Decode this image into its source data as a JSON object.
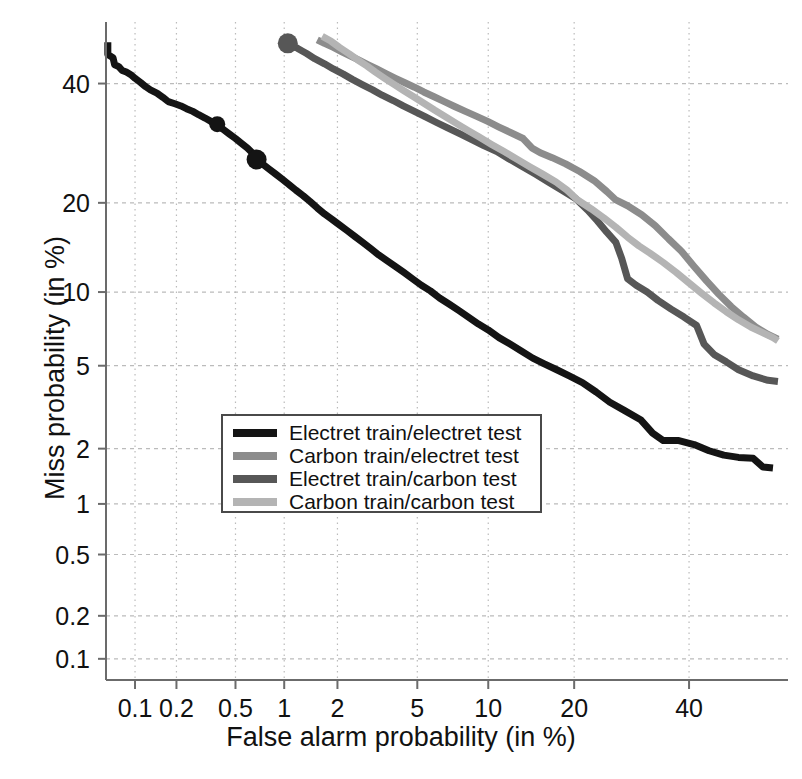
{
  "chart_data": {
    "type": "line",
    "title": "",
    "xlabel": "False alarm probability (in %)",
    "ylabel": "Miss probability (in %)",
    "scale": "probit (DET curve)",
    "grid": true,
    "xtick_labels": [
      "0.1",
      "0.2",
      "0.5",
      "1",
      "2",
      "5",
      "10",
      "20",
      "40"
    ],
    "xtick_values": [
      0.1,
      0.2,
      0.5,
      1,
      2,
      5,
      10,
      20,
      40
    ],
    "ytick_labels": [
      "40",
      "20",
      "10",
      "5",
      "2",
      "1",
      "0.5",
      "0.2",
      "0.1"
    ],
    "ytick_values": [
      40,
      20,
      10,
      5,
      2,
      1,
      0.5,
      0.2,
      0.1
    ],
    "xlim": [
      0.06,
      60
    ],
    "ylim": [
      0.07,
      52
    ],
    "legend_position": "center",
    "series": [
      {
        "name": "Electret train/electret test",
        "color": "#141414",
        "eer_marker": {
          "x": 0.68,
          "y": 26.5
        },
        "extra_marker": {
          "x": 0.38,
          "y": 32.5
        },
        "points": [
          [
            0.062,
            48.0
          ],
          [
            0.062,
            45.6
          ],
          [
            0.068,
            45.0
          ],
          [
            0.07,
            43.6
          ],
          [
            0.075,
            43.3
          ],
          [
            0.08,
            42.5
          ],
          [
            0.086,
            42.2
          ],
          [
            0.093,
            41.7
          ],
          [
            0.1,
            41.0
          ],
          [
            0.11,
            40.2
          ],
          [
            0.12,
            39.4
          ],
          [
            0.13,
            38.8
          ],
          [
            0.145,
            38.2
          ],
          [
            0.16,
            37.4
          ],
          [
            0.175,
            36.6
          ],
          [
            0.195,
            36.2
          ],
          [
            0.215,
            35.8
          ],
          [
            0.235,
            35.3
          ],
          [
            0.26,
            34.8
          ],
          [
            0.285,
            34.2
          ],
          [
            0.315,
            33.6
          ],
          [
            0.345,
            33.0
          ],
          [
            0.38,
            32.5
          ],
          [
            0.415,
            31.6
          ],
          [
            0.455,
            30.8
          ],
          [
            0.5,
            30.0
          ],
          [
            0.545,
            29.2
          ],
          [
            0.595,
            28.4
          ],
          [
            0.65,
            27.4
          ],
          [
            0.68,
            26.5
          ],
          [
            0.74,
            25.8
          ],
          [
            0.81,
            25.0
          ],
          [
            0.89,
            24.2
          ],
          [
            0.975,
            23.4
          ],
          [
            1.07,
            22.6
          ],
          [
            1.17,
            21.8
          ],
          [
            1.29,
            21.0
          ],
          [
            1.41,
            20.2
          ],
          [
            1.55,
            19.3
          ],
          [
            1.7,
            18.5
          ],
          [
            1.87,
            17.8
          ],
          [
            2.05,
            17.1
          ],
          [
            2.25,
            16.4
          ],
          [
            2.47,
            15.7
          ],
          [
            2.71,
            15.0
          ],
          [
            2.98,
            14.3
          ],
          [
            3.27,
            13.6
          ],
          [
            3.59,
            13.0
          ],
          [
            3.94,
            12.4
          ],
          [
            4.33,
            11.8
          ],
          [
            4.75,
            11.2
          ],
          [
            5.22,
            10.6
          ],
          [
            5.73,
            10.1
          ],
          [
            6.29,
            9.5
          ],
          [
            6.91,
            9.0
          ],
          [
            7.59,
            8.5
          ],
          [
            8.33,
            8.0
          ],
          [
            9.15,
            7.5
          ],
          [
            10.0,
            7.1
          ],
          [
            11.0,
            6.6
          ],
          [
            12.1,
            6.2
          ],
          [
            13.3,
            5.8
          ],
          [
            14.6,
            5.4
          ],
          [
            16.0,
            5.1
          ],
          [
            17.6,
            4.8
          ],
          [
            19.3,
            4.5
          ],
          [
            21.2,
            4.2
          ],
          [
            23.3,
            3.8
          ],
          [
            25.5,
            3.4
          ],
          [
            28.0,
            3.1
          ],
          [
            30.8,
            2.8
          ],
          [
            33.0,
            2.4
          ],
          [
            35.0,
            2.2
          ],
          [
            38.0,
            2.2
          ],
          [
            41.0,
            2.1
          ],
          [
            44.0,
            1.95
          ],
          [
            47.0,
            1.85
          ],
          [
            50.0,
            1.8
          ],
          [
            53.0,
            1.78
          ],
          [
            55.0,
            1.6
          ],
          [
            57.0,
            1.58
          ]
        ]
      },
      {
        "name": "Carbon train/electret test",
        "color": "#8c8c8c",
        "points": [
          [
            1.55,
            48.5
          ],
          [
            1.7,
            47.8
          ],
          [
            1.9,
            47.0
          ],
          [
            2.1,
            46.2
          ],
          [
            2.35,
            45.3
          ],
          [
            2.6,
            44.5
          ],
          [
            2.9,
            43.6
          ],
          [
            3.2,
            42.8
          ],
          [
            3.55,
            41.9
          ],
          [
            3.95,
            41.0
          ],
          [
            4.35,
            40.2
          ],
          [
            4.85,
            39.3
          ],
          [
            5.35,
            38.4
          ],
          [
            5.95,
            37.5
          ],
          [
            6.6,
            36.6
          ],
          [
            7.3,
            35.7
          ],
          [
            8.1,
            34.8
          ],
          [
            9.0,
            33.9
          ],
          [
            9.95,
            33.0
          ],
          [
            11.0,
            32.0
          ],
          [
            12.2,
            31.0
          ],
          [
            13.5,
            30.0
          ],
          [
            14.5,
            28.4
          ],
          [
            15.5,
            27.6
          ],
          [
            17.0,
            26.8
          ],
          [
            18.8,
            25.8
          ],
          [
            20.8,
            24.6
          ],
          [
            23.0,
            23.2
          ],
          [
            25.0,
            21.6
          ],
          [
            26.5,
            20.4
          ],
          [
            28.5,
            19.6
          ],
          [
            31.0,
            18.4
          ],
          [
            33.5,
            17.0
          ],
          [
            36.0,
            15.4
          ],
          [
            38.5,
            14.0
          ],
          [
            41.0,
            12.4
          ],
          [
            43.5,
            11.0
          ],
          [
            46.0,
            9.8
          ],
          [
            48.5,
            8.8
          ],
          [
            51.0,
            8.0
          ],
          [
            53.5,
            7.3
          ],
          [
            56.0,
            6.8
          ],
          [
            58.0,
            6.5
          ]
        ]
      },
      {
        "name": "Electret train/carbon test",
        "color": "#575757",
        "eer_marker": {
          "x": 1.05,
          "y": 47.8
        },
        "points": [
          [
            1.05,
            47.8
          ],
          [
            1.2,
            46.8
          ],
          [
            1.35,
            45.8
          ],
          [
            1.5,
            44.8
          ],
          [
            1.7,
            43.8
          ],
          [
            1.9,
            42.8
          ],
          [
            2.15,
            41.8
          ],
          [
            2.4,
            40.8
          ],
          [
            2.7,
            39.8
          ],
          [
            3.05,
            38.8
          ],
          [
            3.4,
            37.8
          ],
          [
            3.85,
            36.8
          ],
          [
            4.3,
            35.8
          ],
          [
            4.85,
            34.8
          ],
          [
            5.45,
            33.8
          ],
          [
            6.1,
            32.8
          ],
          [
            6.85,
            31.8
          ],
          [
            7.7,
            30.8
          ],
          [
            8.6,
            29.8
          ],
          [
            9.6,
            28.8
          ],
          [
            10.8,
            27.8
          ],
          [
            12.0,
            26.6
          ],
          [
            13.4,
            25.4
          ],
          [
            14.9,
            24.2
          ],
          [
            16.5,
            23.0
          ],
          [
            18.3,
            21.8
          ],
          [
            20.2,
            20.6
          ],
          [
            22.0,
            19.0
          ],
          [
            23.5,
            17.6
          ],
          [
            25.0,
            16.2
          ],
          [
            26.5,
            15.0
          ],
          [
            27.5,
            13.2
          ],
          [
            28.5,
            11.2
          ],
          [
            30.0,
            10.6
          ],
          [
            32.0,
            10.0
          ],
          [
            34.0,
            9.3
          ],
          [
            36.5,
            8.6
          ],
          [
            39.0,
            8.0
          ],
          [
            41.5,
            7.4
          ],
          [
            43.0,
            6.2
          ],
          [
            45.0,
            5.6
          ],
          [
            47.5,
            5.2
          ],
          [
            50.0,
            4.8
          ],
          [
            53.0,
            4.5
          ],
          [
            56.0,
            4.3
          ],
          [
            58.0,
            4.25
          ]
        ]
      },
      {
        "name": "Carbon train/carbon test",
        "color": "#b4b4b4",
        "points": [
          [
            1.65,
            49.2
          ],
          [
            1.85,
            48.2
          ],
          [
            2.05,
            47.0
          ],
          [
            2.3,
            45.8
          ],
          [
            2.55,
            44.6
          ],
          [
            2.85,
            43.4
          ],
          [
            3.15,
            42.2
          ],
          [
            3.5,
            41.0
          ],
          [
            3.9,
            39.8
          ],
          [
            4.35,
            38.6
          ],
          [
            4.85,
            37.4
          ],
          [
            5.4,
            36.2
          ],
          [
            6.0,
            35.0
          ],
          [
            6.7,
            33.8
          ],
          [
            7.45,
            32.6
          ],
          [
            8.3,
            31.4
          ],
          [
            9.25,
            30.2
          ],
          [
            10.3,
            29.0
          ],
          [
            11.5,
            27.8
          ],
          [
            12.8,
            26.6
          ],
          [
            14.2,
            25.4
          ],
          [
            15.8,
            24.2
          ],
          [
            17.5,
            23.0
          ],
          [
            19.0,
            21.8
          ],
          [
            20.5,
            20.4
          ],
          [
            22.5,
            19.2
          ],
          [
            24.5,
            18.0
          ],
          [
            26.5,
            16.8
          ],
          [
            28.5,
            15.6
          ],
          [
            30.5,
            14.6
          ],
          [
            32.5,
            13.8
          ],
          [
            35.0,
            12.8
          ],
          [
            37.5,
            11.8
          ],
          [
            40.0,
            10.8
          ],
          [
            42.5,
            9.9
          ],
          [
            45.0,
            9.1
          ],
          [
            47.5,
            8.4
          ],
          [
            50.0,
            7.8
          ],
          [
            52.5,
            7.3
          ],
          [
            55.0,
            6.9
          ],
          [
            57.0,
            6.6
          ],
          [
            58.0,
            6.4
          ]
        ]
      }
    ]
  },
  "axes": {
    "xlabel": "False alarm probability (in %)",
    "ylabel": "Miss probability (in %)"
  },
  "xticks": [
    {
      "label": "0.1"
    },
    {
      "label": "0.2"
    },
    {
      "label": "0.5"
    },
    {
      "label": "1"
    },
    {
      "label": "2"
    },
    {
      "label": "5"
    },
    {
      "label": "10"
    },
    {
      "label": "20"
    },
    {
      "label": "40"
    }
  ],
  "yticks": [
    {
      "label": "40"
    },
    {
      "label": "20"
    },
    {
      "label": "10"
    },
    {
      "label": "5"
    },
    {
      "label": "2"
    },
    {
      "label": "1"
    },
    {
      "label": "0.5"
    },
    {
      "label": "0.2"
    },
    {
      "label": "0.1"
    }
  ],
  "legend": {
    "items": [
      {
        "label": "Electret train/electret test",
        "color": "#141414"
      },
      {
        "label": "Carbon train/electret test",
        "color": "#8c8c8c"
      },
      {
        "label": "Electret train/carbon test",
        "color": "#575757"
      },
      {
        "label": "Carbon train/carbon test",
        "color": "#b4b4b4"
      }
    ]
  },
  "style": {
    "grid_color": "#bbbbbb",
    "axis_color": "#6b6b6b",
    "background": "#ffffff",
    "text_color": "#111111"
  }
}
